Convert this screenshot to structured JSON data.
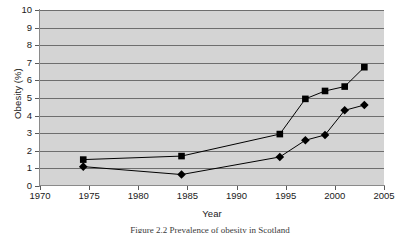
{
  "chart_data": {
    "type": "line",
    "title": "",
    "xlabel": "Year",
    "ylabel": "Obesity (%)",
    "xlim": [
      1970,
      2005
    ],
    "ylim": [
      0,
      10
    ],
    "xticks": [
      1970,
      1975,
      1980,
      1985,
      1990,
      1995,
      2000,
      2005
    ],
    "yticks": [
      0,
      1,
      2,
      3,
      4,
      5,
      6,
      7,
      8,
      9,
      10
    ],
    "grid": "horizontal",
    "legend": "none",
    "plot_background": "#d4d4d4",
    "series": [
      {
        "name": "square-series",
        "marker": "square",
        "color": "#000000",
        "x": [
          1974.4,
          1984.4,
          1994.4,
          1997,
          1999,
          2001,
          2003
        ],
        "values": [
          1.5,
          1.7,
          2.95,
          4.95,
          5.4,
          5.65,
          6.75
        ]
      },
      {
        "name": "diamond-series",
        "marker": "diamond",
        "color": "#000000",
        "x": [
          1974.4,
          1984.4,
          1994.4,
          1997,
          1999,
          2001,
          2003
        ],
        "values": [
          1.1,
          0.65,
          1.65,
          2.6,
          2.9,
          4.3,
          4.6
        ]
      }
    ]
  },
  "axes": {
    "y_title": "Obesity (%)",
    "x_title": "Year",
    "y_tick_labels": [
      "10",
      "9",
      "8",
      "7",
      "6",
      "5",
      "4",
      "3",
      "2",
      "1",
      "0"
    ],
    "x_tick_labels": [
      "1970",
      "1975",
      "1980",
      "1985",
      "1990",
      "1995",
      "2000",
      "2005"
    ]
  },
  "caption": {
    "text": "Figure 2.2 Prevalence of obesity in Scotland"
  }
}
